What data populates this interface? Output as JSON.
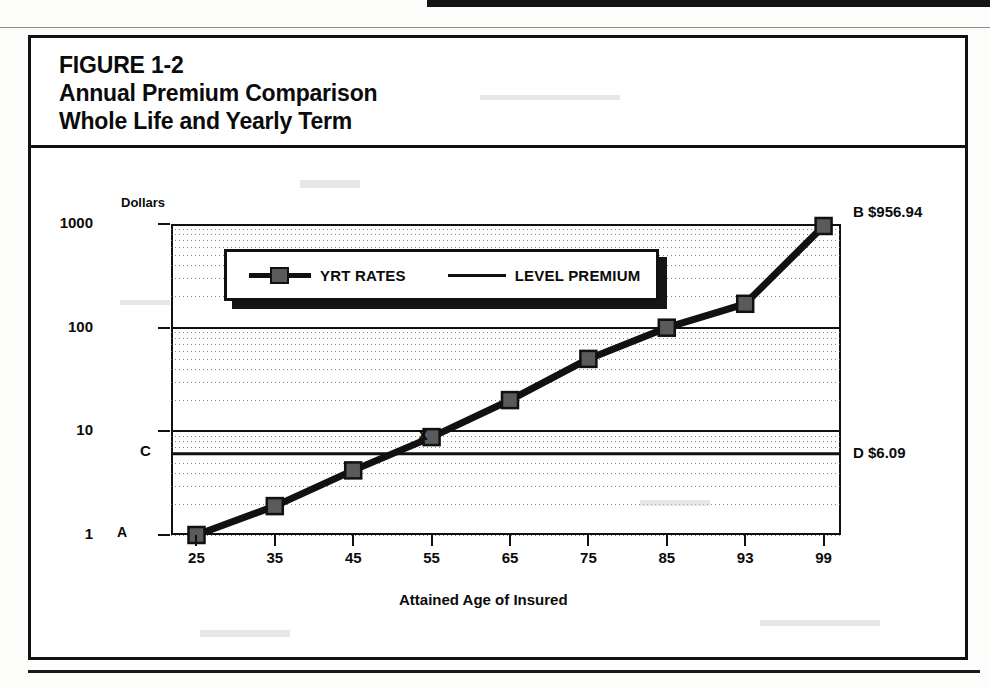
{
  "figure": {
    "title_line_1": "FIGURE 1-2",
    "title_line_2": "Annual Premium Comparison",
    "title_line_3": "Whole Life and Yearly Term"
  },
  "legend": {
    "yrt_label": "YRT RATES",
    "level_label": "LEVEL PREMIUM"
  },
  "annotations": {
    "a": "A",
    "b": "B $956.94",
    "c": "C",
    "d": "D $6.09",
    "x": "X"
  },
  "colors": {
    "ink": "#111111",
    "marker_fill": "#5a5a5a",
    "grid": "#6f6f6f",
    "paper": "#ffffff"
  },
  "chart_data": {
    "type": "line",
    "title": "Annual Premium Comparison Whole Life and Yearly Term",
    "xlabel": "Attained Age of Insured",
    "ylabel": "Dollars",
    "yscale": "log",
    "ylim": [
      1,
      1000
    ],
    "ytick_labels": [
      "1",
      "10",
      "100",
      "1000"
    ],
    "ytick_values": [
      1,
      10,
      100,
      1000
    ],
    "xtick_labels": [
      "25",
      "35",
      "45",
      "55",
      "65",
      "75",
      "85",
      "93",
      "99"
    ],
    "grid": "minor-log-dotted",
    "legend_position": "upper-left-inside",
    "series": [
      {
        "name": "YRT RATES",
        "marker": "square",
        "x": [
          25,
          35,
          45,
          55,
          65,
          75,
          85,
          93,
          99
        ],
        "values": [
          1.0,
          1.9,
          4.2,
          8.8,
          20.0,
          50.0,
          100.0,
          170.0,
          956.94
        ]
      },
      {
        "name": "LEVEL PREMIUM",
        "marker": "none",
        "x": [
          25,
          99
        ],
        "values": [
          6.09,
          6.09
        ]
      }
    ],
    "annotations": [
      {
        "key": "A",
        "text": "A",
        "x": 25,
        "y": 1.0,
        "note": "start of YRT curve"
      },
      {
        "key": "B",
        "text": "B $956.94",
        "x": 99,
        "y": 956.94,
        "note": "end of YRT curve"
      },
      {
        "key": "C",
        "text": "C",
        "x": 25,
        "y": 6.09,
        "note": "level premium at left axis"
      },
      {
        "key": "D",
        "text": "D $6.09",
        "x": 99,
        "y": 6.09,
        "note": "level premium at right axis"
      },
      {
        "key": "X",
        "text": "X",
        "x": 54,
        "y": 6.09,
        "note": "crossover point"
      }
    ]
  }
}
